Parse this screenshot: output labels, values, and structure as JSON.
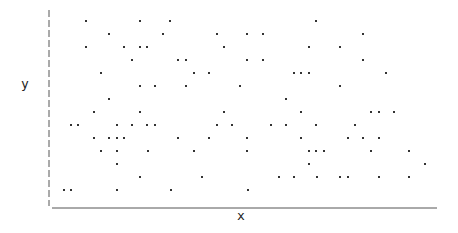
{
  "chart_data": {
    "type": "scatter",
    "title": "",
    "xlabel": "x",
    "ylabel": "y",
    "grid": false,
    "legend": null,
    "axis_style": {
      "y_axis": "dashed",
      "x_axis": "solid"
    },
    "point_color": "#333333",
    "pixel_points": [
      [
        86,
        21
      ],
      [
        140,
        21
      ],
      [
        170,
        21
      ],
      [
        316,
        21
      ],
      [
        109,
        34
      ],
      [
        163,
        34
      ],
      [
        217,
        34
      ],
      [
        247,
        34
      ],
      [
        263,
        34
      ],
      [
        363,
        34
      ],
      [
        86,
        47
      ],
      [
        124,
        47
      ],
      [
        140,
        47
      ],
      [
        147,
        47
      ],
      [
        224,
        47
      ],
      [
        309,
        47
      ],
      [
        340,
        47
      ],
      [
        132,
        60
      ],
      [
        178,
        60
      ],
      [
        186,
        60
      ],
      [
        247,
        60
      ],
      [
        263,
        60
      ],
      [
        363,
        60
      ],
      [
        101,
        73
      ],
      [
        194,
        73
      ],
      [
        209,
        73
      ],
      [
        294,
        73
      ],
      [
        301,
        73
      ],
      [
        309,
        73
      ],
      [
        386,
        73
      ],
      [
        140,
        86
      ],
      [
        155,
        86
      ],
      [
        186,
        86
      ],
      [
        240,
        86
      ],
      [
        340,
        86
      ],
      [
        109,
        99
      ],
      [
        286,
        99
      ],
      [
        94,
        112
      ],
      [
        140,
        112
      ],
      [
        224,
        112
      ],
      [
        301,
        112
      ],
      [
        371,
        112
      ],
      [
        379,
        112
      ],
      [
        394,
        112
      ],
      [
        71,
        125
      ],
      [
        78,
        125
      ],
      [
        117,
        125
      ],
      [
        132,
        125
      ],
      [
        147,
        125
      ],
      [
        155,
        125
      ],
      [
        217,
        125
      ],
      [
        232,
        125
      ],
      [
        271,
        125
      ],
      [
        286,
        125
      ],
      [
        316,
        125
      ],
      [
        355,
        125
      ],
      [
        94,
        138
      ],
      [
        109,
        138
      ],
      [
        117,
        138
      ],
      [
        124,
        138
      ],
      [
        178,
        138
      ],
      [
        209,
        138
      ],
      [
        247,
        138
      ],
      [
        301,
        138
      ],
      [
        348,
        138
      ],
      [
        363,
        138
      ],
      [
        379,
        138
      ],
      [
        101,
        151
      ],
      [
        117,
        151
      ],
      [
        148,
        151
      ],
      [
        194,
        151
      ],
      [
        247,
        151
      ],
      [
        309,
        151
      ],
      [
        316,
        151
      ],
      [
        324,
        151
      ],
      [
        371,
        151
      ],
      [
        409,
        151
      ],
      [
        117,
        164
      ],
      [
        309,
        164
      ],
      [
        425,
        164
      ],
      [
        140,
        177
      ],
      [
        202,
        177
      ],
      [
        279,
        177
      ],
      [
        294,
        177
      ],
      [
        317,
        177
      ],
      [
        340,
        177
      ],
      [
        348,
        177
      ],
      [
        379,
        177
      ],
      [
        409,
        177
      ],
      [
        64,
        190
      ],
      [
        71,
        190
      ],
      [
        117,
        190
      ],
      [
        171,
        190
      ],
      [
        248,
        190
      ]
    ]
  },
  "labels": {
    "x": "x",
    "y": "y"
  }
}
